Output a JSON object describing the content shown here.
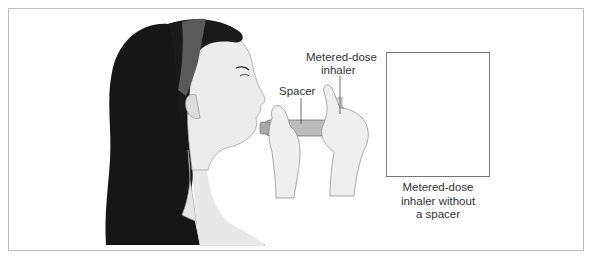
{
  "figure": {
    "labels": {
      "spacer": "Spacer",
      "mdi_line1": "Metered-dose",
      "mdi_line2": "inhaler"
    },
    "inset": {
      "caption_lines": [
        "Metered-dose",
        "inhaler without",
        "a spacer"
      ]
    },
    "colors": {
      "hair": "#151515",
      "headband": "#5a5a5a",
      "skin": "#e9e9e9",
      "inhaler_body": "#8a8a8a",
      "canister": "#e4e4e4",
      "frame_border": "#bdbdbd",
      "inset_border": "#777777"
    }
  }
}
